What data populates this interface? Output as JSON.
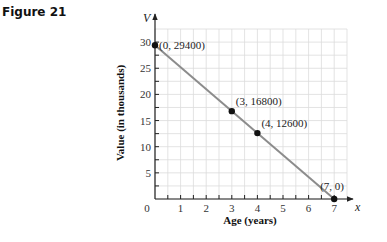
{
  "figure": {
    "label": "Figure 21"
  },
  "chart_data": {
    "type": "line",
    "title": "",
    "xlabel": "Age (years)",
    "ylabel": "Value (in thousands)",
    "x_axis_var": "x",
    "y_axis_var": "V",
    "xlim": [
      0,
      7.5
    ],
    "ylim": [
      0,
      32.5
    ],
    "x_ticks": [
      "0",
      "1",
      "2",
      "3",
      "4",
      "5",
      "6",
      "7"
    ],
    "y_ticks": [
      "5",
      "10",
      "15",
      "20",
      "25",
      "30"
    ],
    "grid": true,
    "series": [
      {
        "name": "Depreciation line",
        "color": "#8c8c8c",
        "x": [
          0,
          7
        ],
        "y": [
          29.4,
          0
        ]
      }
    ],
    "points": [
      {
        "x": 0,
        "y": 29.4,
        "label": "(0, 29400)"
      },
      {
        "x": 3,
        "y": 16.8,
        "label": "(3, 16800)"
      },
      {
        "x": 4,
        "y": 12.6,
        "label": "(4, 12600)"
      },
      {
        "x": 7,
        "y": 0,
        "label": "(7, 0)"
      }
    ],
    "legend": null
  }
}
